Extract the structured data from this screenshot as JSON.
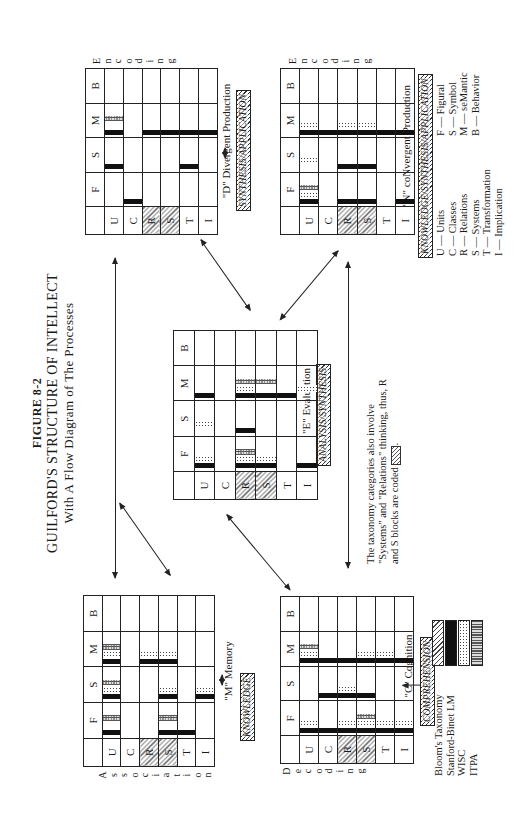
{
  "figure": {
    "number": "FIGURE 8-2",
    "title": "GUILFORD'S STRUCTURE OF INTELLECT",
    "subtitle": "With A Flow Diagram of The Processes"
  },
  "columns": [
    "F",
    "S",
    "M",
    "B"
  ],
  "rows": [
    "U",
    "C",
    "R",
    "S",
    "T",
    "I"
  ],
  "hatched_rows": [
    "R",
    "S"
  ],
  "grids": {
    "divergent": {
      "title": "\"D\" Divergent Production",
      "taxonomy": "SYNTHESIS/APPLICATION",
      "side_label": "Encoding",
      "cells": {
        "U": {
          "F": [],
          "S": [
            "sb"
          ],
          "M": [
            "sb",
            "itpa"
          ],
          "B": []
        },
        "C": {
          "F": [
            "sb"
          ],
          "S": [],
          "M": [],
          "B": []
        },
        "R": {
          "F": [],
          "S": [],
          "M": [
            "sb"
          ],
          "B": []
        },
        "S": {
          "F": [],
          "S": [],
          "M": [
            "sb"
          ],
          "B": []
        },
        "T": {
          "F": [],
          "S": [
            "sb"
          ],
          "M": [
            "sb"
          ],
          "B": []
        },
        "I": {
          "F": [],
          "S": [],
          "M": [
            "sb"
          ],
          "B": []
        }
      }
    },
    "convergent": {
      "title": "\"N\" coNvergent Production",
      "taxonomy": "KNOWLEDGE/SYNTHESIS/APPLICATION",
      "side_label": "Encoding",
      "cells": {
        "U": {
          "F": [
            "sb",
            "wisc",
            "itpa"
          ],
          "S": [
            "wisc"
          ],
          "M": [
            "sb",
            "wisc"
          ],
          "B": []
        },
        "C": {
          "F": [],
          "S": [],
          "M": [
            "sb"
          ],
          "B": []
        },
        "R": {
          "F": [
            "sb"
          ],
          "S": [
            "sb"
          ],
          "M": [
            "sb",
            "wisc"
          ],
          "B": []
        },
        "S": {
          "F": [
            "sb"
          ],
          "S": [
            "sb"
          ],
          "M": [
            "sb",
            "wisc"
          ],
          "B": []
        },
        "T": {
          "F": [],
          "S": [],
          "M": [
            "sb"
          ],
          "B": []
        },
        "I": {
          "F": [
            "sb"
          ],
          "S": [],
          "M": [
            "sb"
          ],
          "B": []
        }
      }
    },
    "evaluation": {
      "title": "\"E\" Evaluation",
      "taxonomy": "ANALYSIS/SYNTHESIS",
      "side_label": "",
      "cells": {
        "U": {
          "F": [
            "sb",
            "wisc"
          ],
          "S": [
            "wisc"
          ],
          "M": [
            "sb"
          ],
          "B": []
        },
        "C": {
          "F": [],
          "S": [],
          "M": [],
          "B": []
        },
        "R": {
          "F": [
            "sb",
            "wisc",
            "itpa"
          ],
          "S": [
            "sb"
          ],
          "M": [
            "sb",
            "wisc",
            "itpa"
          ],
          "B": []
        },
        "S": {
          "F": [
            "sb",
            "wisc"
          ],
          "S": [],
          "M": [
            "sb",
            "itpa"
          ],
          "B": []
        },
        "T": {
          "F": [],
          "S": [],
          "M": [
            "sb"
          ],
          "B": []
        },
        "I": {
          "F": [
            "sb"
          ],
          "S": [],
          "M": [
            "wisc"
          ],
          "B": []
        }
      }
    },
    "memory": {
      "title": "\"M\" Memory",
      "taxonomy": "KNOWLEDGE",
      "side_label": "Association",
      "cells": {
        "U": {
          "F": [
            "sb",
            "itpa"
          ],
          "S": [
            "sb",
            "wisc",
            "itpa"
          ],
          "M": [
            "sb",
            "wisc",
            "itpa"
          ],
          "B": []
        },
        "C": {
          "F": [],
          "S": [],
          "M": [],
          "B": []
        },
        "R": {
          "F": [],
          "S": [],
          "M": [
            "sb",
            "wisc"
          ],
          "B": []
        },
        "S": {
          "F": [
            "sb",
            "itpa"
          ],
          "S": [
            "sb",
            "wisc"
          ],
          "M": [
            "sb",
            "wisc"
          ],
          "B": []
        },
        "T": {
          "F": [
            "sb"
          ],
          "S": [],
          "M": [],
          "B": []
        },
        "I": {
          "F": [],
          "S": [
            "sb",
            "wisc"
          ],
          "M": [],
          "B": []
        }
      }
    },
    "cognition": {
      "title": "\"C\" Cognition",
      "taxonomy": "COMPREHENSION",
      "side_label": "Decoding",
      "cells": {
        "U": {
          "F": [
            "sb",
            "wisc"
          ],
          "S": [],
          "M": [
            "sb",
            "wisc",
            "itpa"
          ],
          "B": []
        },
        "C": {
          "F": [
            "sb"
          ],
          "S": [
            "sb"
          ],
          "M": [
            "sb"
          ],
          "B": []
        },
        "R": {
          "F": [
            "sb",
            "wisc"
          ],
          "S": [
            "sb",
            "wisc"
          ],
          "M": [
            "sb"
          ],
          "B": []
        },
        "S": {
          "F": [
            "sb",
            "wisc",
            "itpa"
          ],
          "S": [
            "sb"
          ],
          "M": [
            "sb",
            "wisc"
          ],
          "B": []
        },
        "T": {
          "F": [
            "sb",
            "wisc"
          ],
          "S": [],
          "M": [
            "sb",
            "wisc"
          ],
          "B": []
        },
        "I": {
          "F": [
            "sb",
            "wisc"
          ],
          "S": [],
          "M": [
            "sb"
          ],
          "B": []
        }
      }
    }
  },
  "note": {
    "line1": "The taxonomy categories also involve",
    "line2": "\"Systems\" and \"Relations\" thinking, thus, R",
    "line3": "and S blocks are coded",
    "end": "."
  },
  "row_key": [
    "U — Units",
    "C — Classes",
    "R — Relations",
    "S — Systems",
    "T — Transformation",
    "I — Implication"
  ],
  "col_key": [
    "F — Figural",
    "S — Symbol",
    "M — seMantic",
    "B — Behavior"
  ],
  "legend": [
    {
      "key": "bloom",
      "label": "Bloom's Taxonomy"
    },
    {
      "key": "sb",
      "label": "Stanford-Binet LM"
    },
    {
      "key": "wisc",
      "label": "WISC"
    },
    {
      "key": "itpa",
      "label": "ITPA"
    }
  ]
}
